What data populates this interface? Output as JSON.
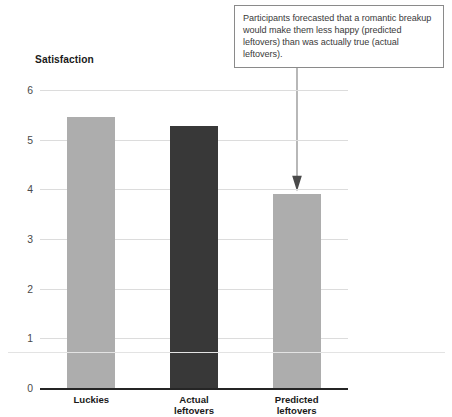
{
  "annotation": {
    "text": "Participants forecasted that a romantic breakup would make them less happy (predicted leftovers) than was actually true (actual leftovers).",
    "arrow_icon": "down-arrow-icon",
    "target_category": "Predicted leftovers",
    "border_color": "#8a8a8a",
    "text_color": "#3a3a3a"
  },
  "chart_data": {
    "type": "bar",
    "title": "",
    "xlabel": "",
    "ylabel": "Satisfaction",
    "categories": [
      "Luckies",
      "Actual leftovers",
      "Predicted leftovers"
    ],
    "category_lines": [
      [
        "Luckies"
      ],
      [
        "Actual",
        "leftovers"
      ],
      [
        "Predicted",
        "leftovers"
      ]
    ],
    "values": [
      5.45,
      5.27,
      3.9
    ],
    "ylim": [
      0,
      6
    ],
    "ytick_labels": [
      "6",
      "5",
      "4",
      "3",
      "2",
      "1",
      "0"
    ],
    "ytick_values": [
      6,
      5,
      4,
      3,
      2,
      1,
      0
    ],
    "grid": true,
    "legend": "none",
    "bar_colors": [
      "#adadad",
      "#383838",
      "#adadad"
    ],
    "annotations": [
      {
        "text": "Participants forecasted that a romantic breakup would make them less happy (predicted leftovers) than was actually true (actual leftovers).",
        "points_to": "Predicted leftovers"
      }
    ]
  },
  "styling": {
    "background": "#ffffff",
    "gridline_color": "#dcdcdc",
    "axis_color": "#252525",
    "tick_text_color": "#4a4a4a",
    "label_text_color": "#1a1a1a"
  }
}
